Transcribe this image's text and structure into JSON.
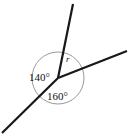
{
  "figure": {
    "kind": "angles-at-a-point-diagram",
    "background_color": "#ffffff",
    "line_color": "#17171c",
    "circle_color": "#8d8d93",
    "text_color": "#101014",
    "vertex": {
      "x": 58,
      "y": 78
    },
    "circle": {
      "cx": 58,
      "cy": 78,
      "r": 26
    },
    "rays": [
      {
        "name": "ray-up",
        "x1": 58,
        "y1": 78,
        "x2": 73,
        "y2": 4
      },
      {
        "name": "ray-right",
        "x1": 58,
        "y1": 78,
        "x2": 127,
        "y2": 51
      },
      {
        "name": "ray-lower-left",
        "x1": 58,
        "y1": 78,
        "x2": 2,
        "y2": 133
      }
    ],
    "labels": [
      {
        "name": "angle-label-140",
        "text": "140°",
        "x": 29,
        "y": 81
      },
      {
        "name": "angle-label-160",
        "text": "160°",
        "x": 47,
        "y": 100
      },
      {
        "name": "angle-label-r",
        "text": "r",
        "x": 66,
        "y": 62
      }
    ]
  },
  "chart_data": {
    "type": "diagram",
    "title": "",
    "vertex_label": "",
    "angles": [
      {
        "label": "140°",
        "value": 140,
        "unit": "degrees",
        "position": "left",
        "between_rays": [
          "ray-up",
          "ray-lower-left"
        ]
      },
      {
        "label": "160°",
        "value": 160,
        "unit": "degrees",
        "position": "bottom",
        "between_rays": [
          "ray-lower-left",
          "ray-right"
        ]
      },
      {
        "label": "r",
        "value": null,
        "unit": "degrees",
        "position": "upper-right",
        "between_rays": [
          "ray-right",
          "ray-up"
        ]
      }
    ],
    "total_degrees_at_point": 360
  }
}
